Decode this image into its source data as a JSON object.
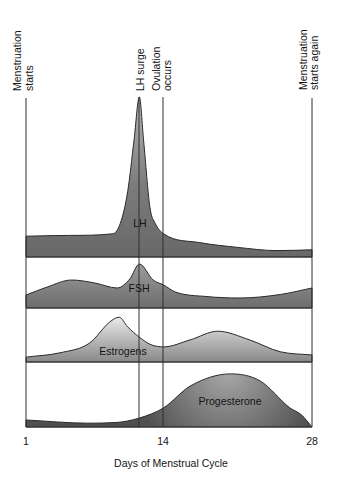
{
  "chart_data": {
    "type": "area",
    "title": "",
    "xlabel": "Days of Menstrual Cycle",
    "ylabel": "",
    "xlim": [
      1,
      28
    ],
    "x_ticks": [
      1,
      14,
      28
    ],
    "x_tick_labels": [
      "1",
      "14",
      "28"
    ],
    "grid": false,
    "legend": "none (each stacked panel labeled inline)",
    "layout": "four stacked panels sharing one x-axis; y = relative hormone level (0-100, unitless)",
    "annotations": [
      {
        "label": "Menstruation starts",
        "lines": [
          "Menstruation",
          "starts"
        ],
        "day": 1
      },
      {
        "label": "LH surge",
        "lines": [
          "LH surge"
        ],
        "day": 11.7
      },
      {
        "label": "Ovulation occurs",
        "lines": [
          "Ovulation",
          "occurs"
        ],
        "day": 14
      },
      {
        "label": "Menstruation starts again",
        "lines": [
          "Menstruation",
          "starts again"
        ],
        "day": 28
      }
    ],
    "series": [
      {
        "name": "LH",
        "fill_top": "#b4b4b4",
        "fill_bottom": "#686868",
        "points": [
          [
            1,
            13
          ],
          [
            5,
            13.5
          ],
          [
            9.2,
            14.5
          ],
          [
            9.9,
            21
          ],
          [
            10.6,
            41
          ],
          [
            11.2,
            73
          ],
          [
            11.7,
            100
          ],
          [
            12.1,
            73
          ],
          [
            12.7,
            31
          ],
          [
            13.2,
            21
          ],
          [
            14,
            14.5
          ],
          [
            17.4,
            9
          ],
          [
            21,
            6
          ],
          [
            24.7,
            4
          ],
          [
            28,
            4.5
          ]
        ]
      },
      {
        "name": "FSH",
        "fill_top": "#a2a2a2",
        "fill_bottom": "#6c6c6c",
        "points": [
          [
            1,
            26
          ],
          [
            3,
            42
          ],
          [
            5.3,
            56
          ],
          [
            7.5,
            50
          ],
          [
            9.6,
            40
          ],
          [
            10.8,
            58
          ],
          [
            11.7,
            88
          ],
          [
            13,
            56
          ],
          [
            14,
            46
          ],
          [
            15.1,
            32
          ],
          [
            18,
            23
          ],
          [
            21.2,
            20
          ],
          [
            25,
            27
          ],
          [
            28,
            40
          ]
        ]
      },
      {
        "name": "Estrogens",
        "fill_top": "#f4f4f4",
        "fill_bottom": "#888888",
        "points": [
          [
            1,
            9
          ],
          [
            4.2,
            17
          ],
          [
            7,
            35
          ],
          [
            8.9,
            74
          ],
          [
            9.8,
            83
          ],
          [
            10.6,
            65
          ],
          [
            11.7,
            46
          ],
          [
            12.8,
            32
          ],
          [
            14,
            28
          ],
          [
            16.5,
            41
          ],
          [
            19.1,
            57
          ],
          [
            22.1,
            41
          ],
          [
            25,
            19
          ],
          [
            28,
            13
          ]
        ]
      },
      {
        "name": "Progesterone",
        "fill_top": "#a8a8a8",
        "fill_bottom": "#505050",
        "points": [
          [
            1,
            11
          ],
          [
            6.8,
            6
          ],
          [
            9.5,
            7
          ],
          [
            11.7,
            14
          ],
          [
            14,
            30
          ],
          [
            16.5,
            64
          ],
          [
            20.3,
            83
          ],
          [
            23.1,
            72
          ],
          [
            25.9,
            30
          ],
          [
            27,
            19
          ],
          [
            28,
            0
          ]
        ]
      }
    ]
  },
  "colors": {
    "lines": "#2e2e2e",
    "text": "#141414",
    "background": "#ffffff"
  }
}
